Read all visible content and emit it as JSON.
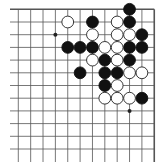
{
  "board": {
    "description": "Go board fragment (upper-right corner)",
    "cols": 12,
    "rows": 12,
    "origin_x": 18.3,
    "origin_y": 9.3,
    "spacing_x": 12.36,
    "spacing_y": 12.7,
    "edge_top": true,
    "edge_right": true,
    "line_color": "#555555",
    "background": "#ffffff",
    "star_points": [
      [
        3,
        2
      ],
      [
        9,
        2
      ],
      [
        9,
        8
      ]
    ],
    "stones": {
      "black": [
        [
          0,
          9
        ],
        [
          1,
          6
        ],
        [
          1,
          9
        ],
        [
          2,
          10
        ],
        [
          3,
          4
        ],
        [
          3,
          5
        ],
        [
          3,
          6
        ],
        [
          3,
          9
        ],
        [
          3,
          10
        ],
        [
          4,
          7
        ],
        [
          4,
          9
        ],
        [
          5,
          5
        ],
        [
          5,
          7
        ],
        [
          5,
          8
        ],
        [
          6,
          7
        ],
        [
          7,
          10
        ]
      ],
      "white": [
        [
          1,
          4
        ],
        [
          1,
          8
        ],
        [
          2,
          6
        ],
        [
          2,
          8
        ],
        [
          2,
          9
        ],
        [
          3,
          7
        ],
        [
          3,
          8
        ],
        [
          4,
          6
        ],
        [
          4,
          8
        ],
        [
          5,
          9
        ],
        [
          5,
          10
        ],
        [
          6,
          8
        ],
        [
          7,
          7
        ],
        [
          7,
          8
        ],
        [
          7,
          9
        ]
      ]
    },
    "colors": {
      "black_stone": "#111111",
      "white_stone": "#ffffff",
      "white_stone_outline": "#222222"
    }
  }
}
